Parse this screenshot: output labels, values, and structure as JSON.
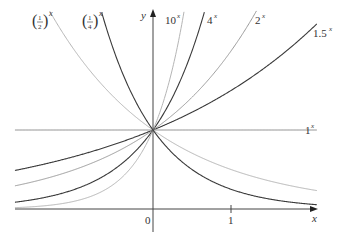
{
  "chart_data": {
    "type": "line",
    "title": "",
    "xlabel": "x",
    "ylabel": "y",
    "xlim": [
      -1.77,
      2.1
    ],
    "ylim": [
      0,
      2.65
    ],
    "grid": false,
    "x_ticks": [
      {
        "value": 0,
        "label": "0"
      },
      {
        "value": 1,
        "label": "1"
      }
    ],
    "series": [
      {
        "name": "1.5^x",
        "base": 1.5,
        "label": "1.5",
        "exp": "x",
        "color": "#3a3a3a",
        "width": 1.1
      },
      {
        "name": "2^x",
        "base": 2,
        "label": "2",
        "exp": "x",
        "color": "#9a9a9a",
        "width": 1.0
      },
      {
        "name": "4^x",
        "base": 4,
        "label": "4",
        "exp": "x",
        "color": "#3a3a3a",
        "width": 1.1
      },
      {
        "name": "10^x",
        "base": 10,
        "label": "10",
        "exp": "x",
        "color": "#b5b5b5",
        "width": 1.0
      },
      {
        "name": "1^x",
        "base": 1,
        "label": "1",
        "exp": "x",
        "color": "#8a8a8a",
        "width": 1.0
      },
      {
        "name": "(1/2)^x",
        "base": 0.5,
        "label": "1/2",
        "exp": "x",
        "color": "#b5b5b5",
        "width": 1.0
      },
      {
        "name": "(1/4)^x",
        "base": 0.25,
        "label": "1/4",
        "exp": "x",
        "color": "#3a3a3a",
        "width": 1.1
      }
    ],
    "annotations": [
      "(1/2)^x",
      "(1/4)^x",
      "10^x",
      "4^x",
      "2^x",
      "1.5^x",
      "1^x"
    ]
  },
  "axes": {
    "x_label": "x",
    "y_label": "y",
    "origin_label": "0",
    "tick_1_label": "1"
  },
  "labels": {
    "half": {
      "num": "1",
      "den": "2",
      "exp": "x"
    },
    "quarter": {
      "num": "1",
      "den": "4",
      "exp": "x"
    },
    "ten": {
      "base": "10",
      "exp": "x"
    },
    "four": {
      "base": "4",
      "exp": "x"
    },
    "two": {
      "base": "2",
      "exp": "x"
    },
    "onefive": {
      "base": "1.5",
      "exp": "x"
    },
    "one": {
      "base": "1",
      "exp": "x"
    }
  }
}
